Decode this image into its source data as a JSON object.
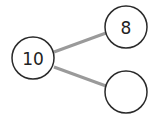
{
  "diagram": {
    "type": "number-bond",
    "colors": {
      "circle_stroke": "#2a2a2a",
      "link": "#9a9a9a",
      "text": "#222222"
    },
    "nodes": [
      {
        "id": "whole",
        "label": "10",
        "cx": 33,
        "cy": 58,
        "r": 21
      },
      {
        "id": "part-top",
        "label": "8",
        "cx": 126,
        "cy": 27,
        "r": 21
      },
      {
        "id": "part-bottom",
        "label": "",
        "cx": 126,
        "cy": 92,
        "r": 21
      }
    ],
    "links": [
      {
        "from": "whole",
        "to": "part-top",
        "x1": 54,
        "y1": 52,
        "x2": 106,
        "y2": 33
      },
      {
        "from": "whole",
        "to": "part-bottom",
        "x1": 54,
        "y1": 67,
        "x2": 106,
        "y2": 86
      }
    ]
  }
}
